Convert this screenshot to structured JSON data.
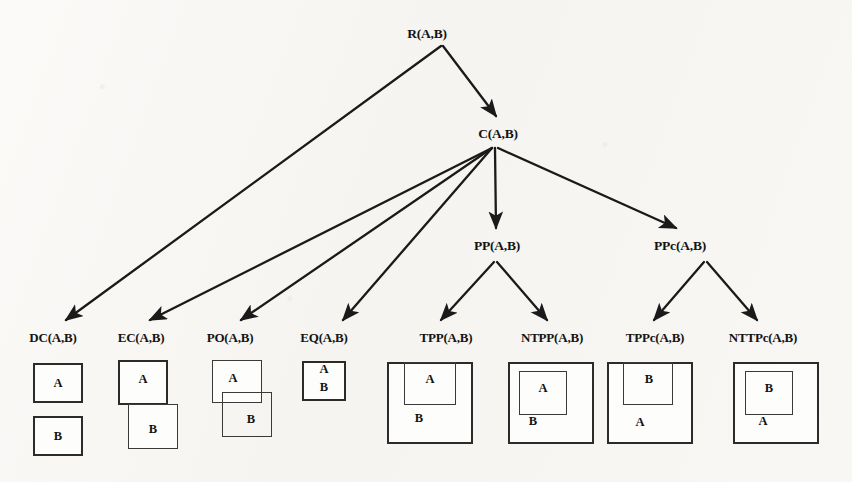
{
  "diagram": {
    "background_color": "#f7f6f3",
    "ink_color": "#1a1a1a"
  },
  "nodes": {
    "root": {
      "label": "R(A,B)",
      "x": 427,
      "y": 26
    },
    "connected": {
      "label": "C(A,B)",
      "x": 498,
      "y": 126
    },
    "pp": {
      "label": "PP(A,B)",
      "x": 497,
      "y": 238
    },
    "ppc": {
      "label": "PPc(A,B)",
      "x": 680,
      "y": 238
    }
  },
  "leaves": [
    {
      "id": "dc",
      "label": "DC(A,B)",
      "x": 53,
      "y": 330
    },
    {
      "id": "ec",
      "label": "EC(A,B)",
      "x": 141,
      "y": 330
    },
    {
      "id": "po",
      "label": "PO(A,B)",
      "x": 230,
      "y": 330
    },
    {
      "id": "eq",
      "label": "EQ(A,B)",
      "x": 324,
      "y": 330
    },
    {
      "id": "tpp",
      "label": "TPP(A,B)",
      "x": 446,
      "y": 330
    },
    {
      "id": "ntpp",
      "label": "NTPP(A,B)",
      "x": 552,
      "y": 330
    },
    {
      "id": "tppc",
      "label": "TPPc(A,B)",
      "x": 655,
      "y": 330
    },
    {
      "id": "nttpc",
      "label": "NTTPc(A,B)",
      "x": 763,
      "y": 330
    }
  ],
  "edges": [
    {
      "id": "root-to-connected",
      "from": "R(A,B)",
      "to": "C(A,B)",
      "x1": 443,
      "y1": 46,
      "x2": 496,
      "y2": 116
    },
    {
      "id": "root-to-dc",
      "from": "R(A,B)",
      "to": "DC(A,B)",
      "x1": 441,
      "y1": 46,
      "x2": 66,
      "y2": 320
    },
    {
      "id": "connected-to-ec",
      "from": "C(A,B)",
      "to": "EC(A,B)",
      "x1": 492,
      "y1": 148,
      "x2": 150,
      "y2": 320
    },
    {
      "id": "connected-to-po",
      "from": "C(A,B)",
      "to": "PO(A,B)",
      "x1": 492,
      "y1": 148,
      "x2": 241,
      "y2": 320
    },
    {
      "id": "connected-to-eq",
      "from": "C(A,B)",
      "to": "EQ(A,B)",
      "x1": 492,
      "y1": 148,
      "x2": 343,
      "y2": 320
    },
    {
      "id": "connected-to-pp",
      "from": "C(A,B)",
      "to": "PP(A,B)",
      "x1": 495,
      "y1": 148,
      "x2": 496,
      "y2": 228
    },
    {
      "id": "connected-to-ppc",
      "from": "C(A,B)",
      "to": "PPc(A,B)",
      "x1": 498,
      "y1": 148,
      "x2": 676,
      "y2": 228
    },
    {
      "id": "pp-to-tpp",
      "from": "PP(A,B)",
      "to": "TPP(A,B)",
      "x1": 494,
      "y1": 262,
      "x2": 441,
      "y2": 320
    },
    {
      "id": "pp-to-ntpp",
      "from": "PP(A,B)",
      "to": "NTPP(A,B)",
      "x1": 497,
      "y1": 262,
      "x2": 547,
      "y2": 320
    },
    {
      "id": "ppc-to-tppc",
      "from": "PPc(A,B)",
      "to": "TPPc(A,B)",
      "x1": 704,
      "y1": 262,
      "x2": 654,
      "y2": 320
    },
    {
      "id": "ppc-to-nttpc",
      "from": "PPc(A,B)",
      "to": "NTTPc(A,B)",
      "x1": 707,
      "y1": 262,
      "x2": 757,
      "y2": 320
    }
  ],
  "figures": [
    {
      "id": "dc",
      "caption": "DC(A,B)",
      "description": "two disjoint separated squares, A above B",
      "boxes": [
        {
          "label": "A",
          "x": 33,
          "y": 363,
          "w": 50,
          "h": 40,
          "label_x": 58,
          "label_y": 376
        },
        {
          "label": "B",
          "x": 33,
          "y": 416,
          "w": 50,
          "h": 40,
          "label_x": 58,
          "label_y": 429
        }
      ]
    },
    {
      "id": "ec",
      "caption": "EC(A,B)",
      "description": "two squares touching edge-to-edge, A upper-left and B lower-right",
      "boxes": [
        {
          "label": "A",
          "x": 118,
          "y": 360,
          "w": 50,
          "h": 45,
          "label_x": 143,
          "label_y": 372
        },
        {
          "label": "B",
          "x": 128,
          "y": 404,
          "w": 50,
          "h": 45,
          "label_x": 153,
          "label_y": 422
        }
      ]
    },
    {
      "id": "po",
      "caption": "PO(A,B)",
      "description": "two partially overlapping squares, A upper-left and B lower-right",
      "boxes": [
        {
          "label": "A",
          "x": 212,
          "y": 360,
          "w": 50,
          "h": 43,
          "label_x": 233,
          "label_y": 371
        },
        {
          "label": "B",
          "x": 222,
          "y": 392,
          "w": 50,
          "h": 45,
          "label_x": 251,
          "label_y": 412
        }
      ]
    },
    {
      "id": "eq",
      "caption": "EQ(A,B)",
      "description": "one square containing both labels A and B, identical regions",
      "boxes": [
        {
          "label": "A",
          "x": 302,
          "y": 361,
          "w": 44,
          "h": 40,
          "label_x": 324,
          "label_y": 363
        },
        {
          "label": "B",
          "x": null,
          "y": null,
          "w": null,
          "h": null,
          "label_x": 324,
          "label_y": 381
        }
      ]
    },
    {
      "id": "tpp",
      "caption": "TPP(A,B)",
      "description": "A inside B and touching B's top-left boundary",
      "boxes": [
        {
          "label": "B",
          "x": 387,
          "y": 362,
          "w": 86,
          "h": 82,
          "label_x": 419,
          "label_y": 411
        },
        {
          "label": "A",
          "x": 404,
          "y": 362,
          "w": 52,
          "h": 43,
          "label_x": 430,
          "label_y": 372
        }
      ]
    },
    {
      "id": "ntpp",
      "caption": "NTPP(A,B)",
      "description": "A strictly inside B, not touching the boundary",
      "boxes": [
        {
          "label": "B",
          "x": 508,
          "y": 362,
          "w": 86,
          "h": 82,
          "label_x": 533,
          "label_y": 414
        },
        {
          "label": "A",
          "x": 519,
          "y": 371,
          "w": 48,
          "h": 44,
          "label_x": 543,
          "label_y": 381
        }
      ]
    },
    {
      "id": "tppc",
      "caption": "TPPc(A,B)",
      "description": "B inside A and touching A's top boundary",
      "boxes": [
        {
          "label": "A",
          "x": 607,
          "y": 362,
          "w": 86,
          "h": 82,
          "label_x": 640,
          "label_y": 415
        },
        {
          "label": "B",
          "x": 623,
          "y": 362,
          "w": 50,
          "h": 43,
          "label_x": 649,
          "label_y": 372
        }
      ]
    },
    {
      "id": "nttpc",
      "caption": "NTTPc(A,B)",
      "description": "B strictly inside A, not touching the boundary",
      "boxes": [
        {
          "label": "A",
          "x": 733,
          "y": 362,
          "w": 86,
          "h": 82,
          "label_x": 763,
          "label_y": 414
        },
        {
          "label": "B",
          "x": 745,
          "y": 371,
          "w": 48,
          "h": 44,
          "label_x": 769,
          "label_y": 381
        }
      ]
    }
  ]
}
